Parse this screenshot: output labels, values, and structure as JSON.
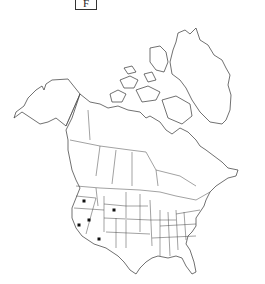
{
  "panel": {
    "label": "F"
  },
  "map": {
    "region": "North America",
    "features": [
      "Alaska",
      "Canada",
      "Greenland",
      "United States",
      "Mexico (northern)"
    ],
    "boundaries": "state and province outlines",
    "colors": {
      "background": "#ffffff",
      "outline": "#333333",
      "marker": "#111111"
    }
  },
  "occurrence_markers": [
    {
      "region": "Oregon",
      "x": 84,
      "y": 201
    },
    {
      "region": "Wyoming",
      "x": 114,
      "y": 210
    },
    {
      "region": "Nevada",
      "x": 89,
      "y": 220
    },
    {
      "region": "California",
      "x": 79,
      "y": 225
    },
    {
      "region": "Arizona",
      "x": 99,
      "y": 239
    }
  ]
}
